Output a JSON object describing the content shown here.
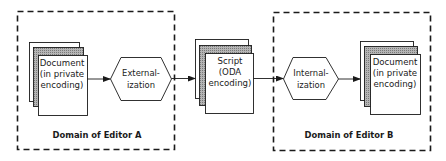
{
  "colors": {
    "ink": "#1a1a1a",
    "paper": "#ffffff",
    "sheet_shade": "#9a9a9a",
    "background": "#ffffff"
  },
  "domains": [
    {
      "id": "editor-a",
      "label": "Domain of Editor A"
    },
    {
      "id": "editor-b",
      "label": "Domain of Editor B"
    }
  ],
  "nodes": {
    "doc_a": {
      "lines": [
        "Document",
        "(in private",
        "encoding)"
      ]
    },
    "externalization": {
      "lines": [
        "External-",
        "ization"
      ]
    },
    "script": {
      "lines": [
        "Script",
        "(ODA",
        "encoding)"
      ]
    },
    "internalization": {
      "lines": [
        "Internal-",
        "ization"
      ]
    },
    "doc_b": {
      "lines": [
        "Document",
        "(in private",
        "encoding)"
      ]
    }
  },
  "edges": [
    {
      "from": "doc_a",
      "to": "externalization"
    },
    {
      "from": "externalization",
      "to": "script"
    },
    {
      "from": "script",
      "to": "internalization"
    },
    {
      "from": "internalization",
      "to": "doc_b"
    }
  ]
}
